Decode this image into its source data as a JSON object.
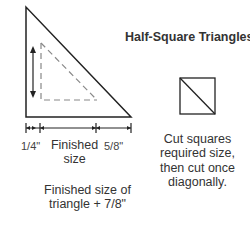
{
  "title": "Half-Square Triangles",
  "triangle_diagram": {
    "seam_allowance_label": "1/4\"",
    "finished_label": "Finished size",
    "extra_label": "5/8\"",
    "total_label": "Finished size of triangle + 7/8\""
  },
  "square_diagram": {
    "caption": "Cut squares required size, then cut once diagonally."
  },
  "colors": {
    "line": "#222222",
    "dashed": "#888888",
    "text": "#333333"
  }
}
